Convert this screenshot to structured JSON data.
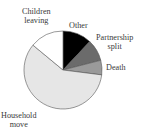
{
  "chart_data": {
    "type": "pie",
    "title": "",
    "start_angle_deg": 0,
    "direction": "clockwise",
    "slices": [
      {
        "label": "Other",
        "value": 12,
        "color": "#000000"
      },
      {
        "label": "Partnership split",
        "value": 9,
        "color": "#6b6b6b"
      },
      {
        "label": "Death",
        "value": 6,
        "color": "#9a9a9a"
      },
      {
        "label": "Household move",
        "value": 59,
        "color": "#e6e6e6"
      },
      {
        "label": "Children leaving",
        "value": 14,
        "color": "#ffffff"
      }
    ]
  },
  "labels": {
    "other": "Other",
    "partnership_line1": "Partnership",
    "partnership_line2": "split",
    "death": "Death",
    "household_line1": "Household",
    "household_line2": "move",
    "children_line1": "Children",
    "children_line2": "leaving"
  }
}
